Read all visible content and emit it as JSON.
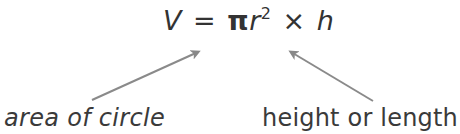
{
  "formula": {
    "lhs": "V",
    "equals": "=",
    "pi": "π",
    "r": "r",
    "exponent": "2",
    "times": "×",
    "h": "h"
  },
  "labels": {
    "left": "area of circle",
    "right": "height or length"
  },
  "arrows": [
    {
      "name": "arrow-to-area",
      "from": [
        92,
        100
      ],
      "to": [
        202,
        50
      ],
      "color": "#888888"
    },
    {
      "name": "arrow-to-height",
      "from": [
        373,
        101
      ],
      "to": [
        287,
        50
      ],
      "color": "#888888"
    }
  ],
  "colors": {
    "text": "#333333",
    "arrow": "#888888",
    "background": "#ffffff"
  }
}
